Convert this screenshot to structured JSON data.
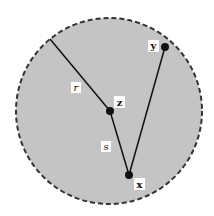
{
  "diagram": {
    "type": "geometry",
    "colors": {
      "disk_fill": "#c4c4c4",
      "disk_border": "#333333",
      "line": "#111111",
      "point": "#111111",
      "label_bg": "#ffffff"
    },
    "points": [
      {
        "id": "z",
        "label": "z"
      },
      {
        "id": "x",
        "label": "x"
      },
      {
        "id": "y",
        "label": "y"
      }
    ],
    "segments": [
      {
        "id": "r",
        "label": "r",
        "from": "boundary",
        "to": "z"
      },
      {
        "id": "s",
        "label": "s",
        "from": "z",
        "to": "x"
      },
      {
        "id": "xy",
        "label": "",
        "from": "x",
        "to": "y"
      }
    ]
  }
}
